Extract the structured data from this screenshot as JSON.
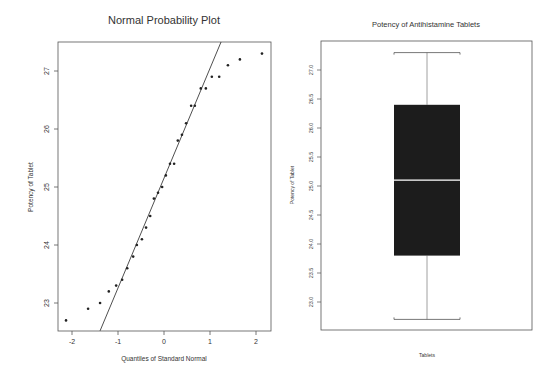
{
  "chart_data": [
    {
      "type": "scatter",
      "title": "Normal Probability Plot",
      "xlabel": "Quantiles of Standard Normal",
      "ylabel": "Potency of Tablet",
      "xlim": [
        -2.3,
        2.3
      ],
      "ylim": [
        22.5,
        27.5
      ],
      "x_ticks": [
        "-2",
        "-1",
        "0",
        "1",
        "2"
      ],
      "y_ticks": [
        "23",
        "24",
        "25",
        "26",
        "27"
      ],
      "grid": false,
      "legend": null,
      "reference_line": {
        "x1": -1.39,
        "y1": 22.52,
        "x2": 1.24,
        "y2": 27.5
      },
      "points": [
        {
          "x": -2.13,
          "y": 22.7
        },
        {
          "x": -1.65,
          "y": 22.9
        },
        {
          "x": -1.39,
          "y": 23.0
        },
        {
          "x": -1.2,
          "y": 23.2
        },
        {
          "x": -1.04,
          "y": 23.3
        },
        {
          "x": -0.91,
          "y": 23.4
        },
        {
          "x": -0.8,
          "y": 23.6
        },
        {
          "x": -0.67,
          "y": 23.8
        },
        {
          "x": -0.59,
          "y": 24.0
        },
        {
          "x": -0.48,
          "y": 24.1
        },
        {
          "x": -0.39,
          "y": 24.3
        },
        {
          "x": -0.3,
          "y": 24.5
        },
        {
          "x": -0.22,
          "y": 24.8
        },
        {
          "x": -0.13,
          "y": 24.9
        },
        {
          "x": -0.04,
          "y": 25.0
        },
        {
          "x": 0.04,
          "y": 25.2
        },
        {
          "x": 0.13,
          "y": 25.4
        },
        {
          "x": 0.22,
          "y": 25.4
        },
        {
          "x": 0.3,
          "y": 25.8
        },
        {
          "x": 0.39,
          "y": 25.9
        },
        {
          "x": 0.48,
          "y": 26.1
        },
        {
          "x": 0.59,
          "y": 26.4
        },
        {
          "x": 0.67,
          "y": 26.4
        },
        {
          "x": 0.8,
          "y": 26.7
        },
        {
          "x": 0.91,
          "y": 26.7
        },
        {
          "x": 1.04,
          "y": 26.9
        },
        {
          "x": 1.2,
          "y": 26.9
        },
        {
          "x": 1.39,
          "y": 27.1
        },
        {
          "x": 1.65,
          "y": 27.2
        },
        {
          "x": 2.13,
          "y": 27.3
        }
      ]
    },
    {
      "type": "box",
      "title": "Potency of Antihistamine Tablets",
      "xlabel": "Tablets",
      "ylabel": "Potency of Tablet",
      "ylim": [
        22.5,
        27.5
      ],
      "y_ticks": [
        "23.0",
        "23.5",
        "24.0",
        "24.5",
        "25.0",
        "25.5",
        "26.0",
        "26.5",
        "27.0"
      ],
      "categories": [
        "Tablets"
      ],
      "grid": false,
      "legend": null,
      "box": {
        "min": 22.7,
        "q1": 23.8,
        "median": 25.1,
        "q3": 26.4,
        "max": 27.3
      },
      "box_color": "#1c1c1c",
      "median_color": "#ffffff"
    }
  ]
}
